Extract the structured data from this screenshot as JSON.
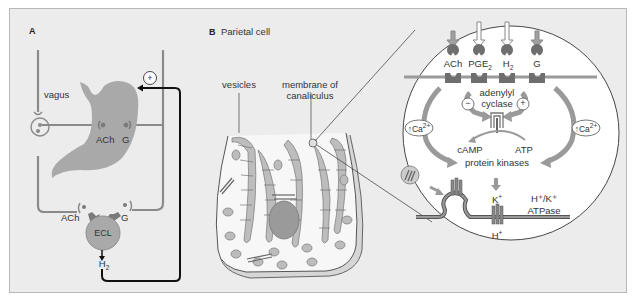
{
  "panel_a": {
    "letter": "A",
    "labels": {
      "vagus": "vagus",
      "ach_stomach": "ACh",
      "g_stomach": "G",
      "ach_ecl": "ACh",
      "g_ecl": "G",
      "ecl": "ECL",
      "h2": "H",
      "h2_sub": "2",
      "plus": "+"
    }
  },
  "panel_b": {
    "letter": "B",
    "title": "Parietal cell",
    "labels": {
      "vesicles": "vesicles",
      "membrane_line1": "membrane of",
      "membrane_line2": "canaliculus"
    }
  },
  "inset": {
    "receptors": [
      {
        "label": "ACh",
        "sub": ""
      },
      {
        "label": "PGE",
        "sub": "2"
      },
      {
        "label": "H",
        "sub": "2"
      },
      {
        "label": "G",
        "sub": ""
      }
    ],
    "adenylyl": "adenylyl",
    "cyclase": "cyclase",
    "minus": "−",
    "plus": "+",
    "ca_left": "↑Ca",
    "ca_right": "↑Ca",
    "ca_sup": "2+",
    "camp": "cAMP",
    "atp": "ATP",
    "protein_kinases": "protein kinases",
    "k_plus": "K",
    "h_plus": "H",
    "ion_sup": "+",
    "pump_line1": "H⁺/K⁺",
    "pump_line2": "ATPase"
  },
  "colors": {
    "background": "#ececec",
    "grey_line": "#8a8a8a",
    "dark_line": "#111111",
    "receptor": "#6e6e6e",
    "stomach": "#a9a9a9",
    "cell_fill": "#f7f7f7"
  }
}
